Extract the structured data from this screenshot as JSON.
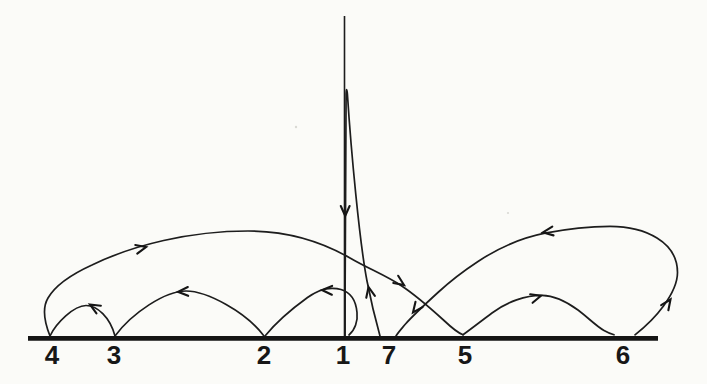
{
  "figure": {
    "background_color": "#fbfbf8",
    "ink_color": "#1d1d1d",
    "baseline_order_left_to_right": [
      "4",
      "3",
      "2",
      "1",
      "7",
      "5",
      "6"
    ],
    "points": [
      {
        "label": "4"
      },
      {
        "label": "3"
      },
      {
        "label": "2"
      },
      {
        "label": "1"
      },
      {
        "label": "7"
      },
      {
        "label": "5"
      },
      {
        "label": "6"
      }
    ],
    "arcs": [
      {
        "from": "1",
        "to": "2"
      },
      {
        "from": "2",
        "to": "3"
      },
      {
        "from": "3",
        "to": "4"
      },
      {
        "from": "4",
        "to": "5"
      },
      {
        "from": "5",
        "to": "6"
      },
      {
        "from": "6",
        "to": "7"
      },
      {
        "from": "7",
        "to": "1"
      }
    ],
    "arrow_count": 11
  }
}
